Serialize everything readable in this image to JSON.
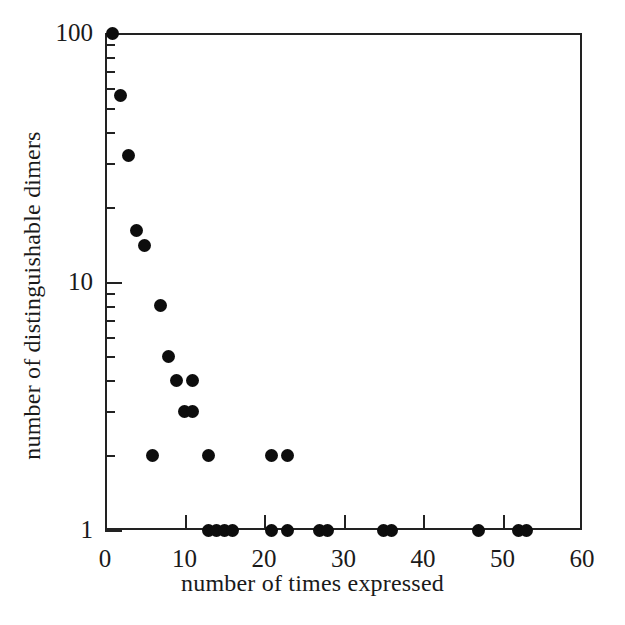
{
  "chart_data": {
    "type": "scatter",
    "title": "",
    "xlabel": "number of times expressed",
    "ylabel": "number of distinguishable dimers",
    "xlim": [
      0,
      60
    ],
    "ylim": [
      1,
      100
    ],
    "yscale": "log",
    "xscale": "linear",
    "grid": false,
    "legend": null,
    "xticks": [
      0,
      10,
      20,
      30,
      40,
      50,
      60
    ],
    "xtick_labels": [
      "0",
      "10",
      "20",
      "30",
      "40",
      "50",
      "60"
    ],
    "yticks": [
      1,
      10,
      100
    ],
    "ytick_labels": [
      "1",
      "10",
      "100"
    ],
    "y_minor_ticks": [
      2,
      3,
      4,
      5,
      6,
      7,
      8,
      9,
      20,
      30,
      40,
      50,
      60,
      70,
      80,
      90
    ],
    "marker": "filled-circle",
    "marker_color": "#0d0d0d",
    "marker_size_px": 13,
    "points": [
      {
        "x": 1,
        "y": 100
      },
      {
        "x": 2,
        "y": 56
      },
      {
        "x": 3,
        "y": 32
      },
      {
        "x": 4,
        "y": 16
      },
      {
        "x": 5,
        "y": 14
      },
      {
        "x": 7,
        "y": 8
      },
      {
        "x": 6,
        "y": 2
      },
      {
        "x": 8,
        "y": 5
      },
      {
        "x": 9,
        "y": 4
      },
      {
        "x": 11,
        "y": 4
      },
      {
        "x": 10,
        "y": 3
      },
      {
        "x": 11,
        "y": 3
      },
      {
        "x": 13,
        "y": 2
      },
      {
        "x": 21,
        "y": 2
      },
      {
        "x": 23,
        "y": 2
      },
      {
        "x": 13,
        "y": 1
      },
      {
        "x": 14,
        "y": 1
      },
      {
        "x": 15,
        "y": 1
      },
      {
        "x": 16,
        "y": 1
      },
      {
        "x": 21,
        "y": 1
      },
      {
        "x": 23,
        "y": 1
      },
      {
        "x": 27,
        "y": 1
      },
      {
        "x": 28,
        "y": 1
      },
      {
        "x": 35,
        "y": 1
      },
      {
        "x": 36,
        "y": 1
      },
      {
        "x": 47,
        "y": 1
      },
      {
        "x": 52,
        "y": 1
      },
      {
        "x": 53,
        "y": 1
      }
    ]
  },
  "axes": {
    "x_title": "number of times expressed",
    "y_title": "number of distinguishable dimers"
  }
}
